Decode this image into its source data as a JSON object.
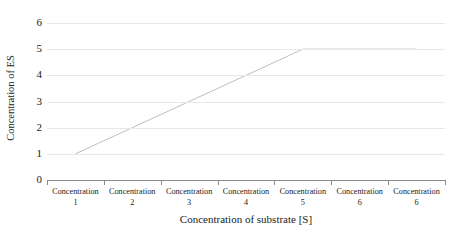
{
  "chart_data": {
    "type": "line",
    "title": "",
    "xlabel": "Concentration of substrate [S]",
    "ylabel": "Concentration of ES",
    "categories": [
      "Concentration 1",
      "Concentration 2",
      "Concentration 3",
      "Concentration 4",
      "Concentration 5",
      "Concentration 6",
      "Concentration 6"
    ],
    "category_parts": [
      {
        "name": "Concentration",
        "num": "1"
      },
      {
        "name": "Concentration",
        "num": "2"
      },
      {
        "name": "Concentration",
        "num": "3"
      },
      {
        "name": "Concentration",
        "num": "4"
      },
      {
        "name": "Concentration",
        "num": "5"
      },
      {
        "name": "Concentration",
        "num": "6"
      },
      {
        "name": "Concentration",
        "num": "6"
      }
    ],
    "values": [
      1,
      2,
      3,
      4,
      5,
      5,
      5
    ],
    "ylim": [
      0,
      6
    ],
    "ytick_labels": [
      "6",
      "5",
      "4",
      "3",
      "2",
      "1",
      "0"
    ],
    "ytick_values": [
      6,
      5,
      4,
      3,
      2,
      1,
      0
    ],
    "grid": true,
    "grid_axis": "y",
    "legend": false,
    "legend_position": "none",
    "series_color": "#bfbfbf",
    "grid_color": "#e8e8e8",
    "axis_color": "#8a8a8a",
    "background_color": "#ffffff",
    "text_color": "#1a1a1a"
  }
}
